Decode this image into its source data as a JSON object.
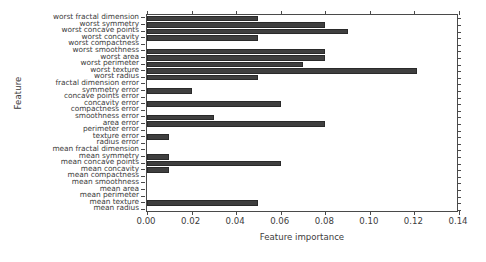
{
  "chart_data": {
    "type": "bar",
    "orientation": "horizontal",
    "title": "",
    "xlabel": "Feature importance",
    "ylabel": "Feature",
    "xlim": [
      0.0,
      0.14
    ],
    "xticks": [
      "0.00",
      "0.02",
      "0.04",
      "0.06",
      "0.08",
      "0.10",
      "0.12",
      "0.14"
    ],
    "xtick_values": [
      0.0,
      0.02,
      0.04,
      0.06,
      0.08,
      0.1,
      0.12,
      0.14
    ],
    "grid": false,
    "legend": null,
    "bar_color": "#3f3f3f",
    "edge_color": "#2a2a2a",
    "categories": [
      "mean radius",
      "mean texture",
      "mean perimeter",
      "mean area",
      "mean smoothness",
      "mean compactness",
      "mean concavity",
      "mean concave points",
      "mean symmetry",
      "mean fractal dimension",
      "radius error",
      "texture error",
      "perimeter error",
      "area error",
      "smoothness error",
      "compactness error",
      "concavity error",
      "concave points error",
      "symmetry error",
      "fractal dimension error",
      "worst radius",
      "worst texture",
      "worst perimeter",
      "worst area",
      "worst smoothness",
      "worst compactness",
      "worst concavity",
      "worst concave points",
      "worst symmetry",
      "worst fractal dimension"
    ],
    "values": [
      0.0,
      0.05,
      0.0,
      0.0,
      0.0,
      0.0,
      0.01,
      0.06,
      0.01,
      0.0,
      0.0,
      0.01,
      0.0,
      0.08,
      0.03,
      0.0,
      0.06,
      0.0,
      0.02,
      0.0,
      0.05,
      0.121,
      0.07,
      0.08,
      0.08,
      0.0,
      0.05,
      0.09,
      0.08,
      0.05
    ]
  }
}
